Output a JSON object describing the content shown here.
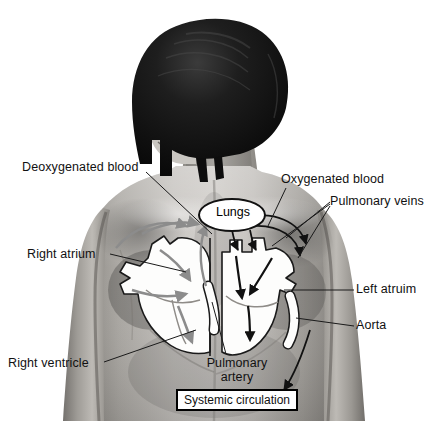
{
  "figure": {
    "type": "anatomical-diagram",
    "background_color": "#ffffff",
    "body": {
      "description": "grayscale photograph of a person seen from behind, head turned to the left, wearing no top, with heart diagram overlaid on the back",
      "hair_color": "#121212",
      "skin_tone_light": "#d2d0cd",
      "skin_tone_mid": "#9a9792",
      "skin_tone_dark": "#5e5b57"
    },
    "heart": {
      "chamber_fill": "#fdfdfc",
      "outline_color": "#1a1a1a",
      "deoxygenated_arrow_color": "#8c8c8c",
      "oxygenated_arrow_color": "#111111"
    }
  },
  "labels": {
    "deoxygenated_blood": "Deoxygenated blood",
    "oxygenated_blood": "Oxygenated blood",
    "pulmonary_veins": "Pulmonary veins",
    "right_atrium": "Right atrium",
    "left_atrium": "Left atruim",
    "aorta": "Aorta",
    "right_ventricle": "Right ventricle",
    "pulmonary_artery_line1": "Pulmonary",
    "pulmonary_artery_line2": "artery",
    "lungs": "Lungs",
    "systemic_circulation": "Systemic circulation"
  }
}
